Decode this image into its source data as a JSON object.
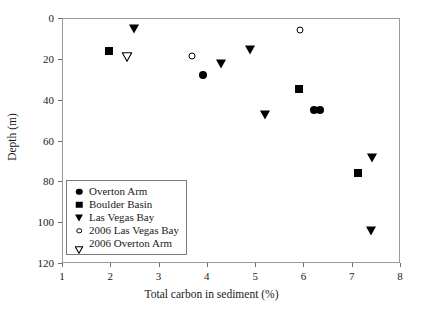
{
  "chart_data": {
    "type": "scatter",
    "title": "",
    "xlabel": "Total carbon in sediment (%)",
    "ylabel": "Depth (m)",
    "xlim": [
      1,
      8
    ],
    "ylim": [
      0,
      120
    ],
    "y_inverted": true,
    "grid": false,
    "legend_position": "lower-left",
    "xticks": [
      "1",
      "2",
      "3",
      "4",
      "5",
      "6",
      "7",
      "8"
    ],
    "xtick_values": [
      1,
      2,
      3,
      4,
      5,
      6,
      7,
      8
    ],
    "yticks": [
      "0",
      "20",
      "40",
      "60",
      "80",
      "100",
      "120"
    ],
    "ytick_values": [
      0,
      20,
      40,
      60,
      80,
      100,
      120
    ],
    "series": [
      {
        "name": "Overton Arm",
        "marker": "circle-filled",
        "color": "#000000",
        "points": [
          {
            "x": 3.92,
            "y": 28
          },
          {
            "x": 6.22,
            "y": 45
          },
          {
            "x": 6.34,
            "y": 45
          }
        ]
      },
      {
        "name": "Boulder Basin",
        "marker": "square-filled",
        "color": "#000000",
        "points": [
          {
            "x": 1.97,
            "y": 16
          },
          {
            "x": 5.9,
            "y": 35
          },
          {
            "x": 7.13,
            "y": 76
          }
        ]
      },
      {
        "name": "Las Vegas Bay",
        "marker": "triangle-down-filled",
        "color": "#000000",
        "points": [
          {
            "x": 2.5,
            "y": 6
          },
          {
            "x": 4.9,
            "y": 16
          },
          {
            "x": 4.3,
            "y": 23
          },
          {
            "x": 5.2,
            "y": 48
          },
          {
            "x": 7.43,
            "y": 69
          },
          {
            "x": 7.4,
            "y": 105
          }
        ]
      },
      {
        "name": "2006 Las Vegas Bay",
        "marker": "circle-open",
        "color": "#000000",
        "points": [
          {
            "x": 3.7,
            "y": 18.5
          },
          {
            "x": 5.93,
            "y": 6
          }
        ]
      },
      {
        "name": "2006 Overton Arm",
        "marker": "triangle-down-open",
        "color": "#000000",
        "points": [
          {
            "x": 2.35,
            "y": 17
          }
        ]
      }
    ]
  },
  "legend": {
    "items": [
      {
        "label": "Overton Arm",
        "marker": "circle-filled"
      },
      {
        "label": "Boulder Basin",
        "marker": "square-filled"
      },
      {
        "label": "Las Vegas Bay",
        "marker": "triangle-down-filled"
      },
      {
        "label": "2006 Las Vegas Bay",
        "marker": "circle-open"
      },
      {
        "label": "2006 Overton Arm",
        "marker": "triangle-down-open"
      }
    ]
  }
}
